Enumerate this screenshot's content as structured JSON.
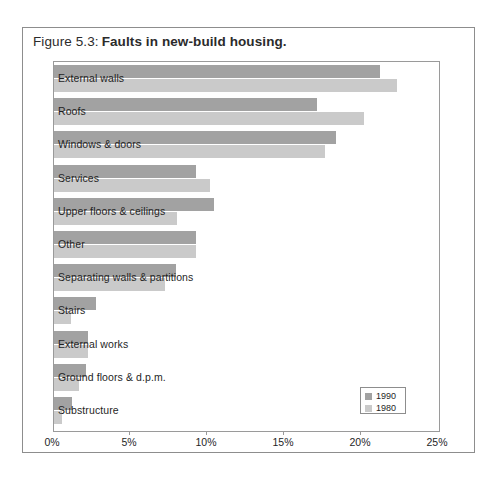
{
  "figure": {
    "number": "Figure 5.3:",
    "title": "Faults in new-build housing."
  },
  "legend": {
    "items": [
      {
        "label": "1990",
        "color": "#a2a2a2"
      },
      {
        "label": "1980",
        "color": "#cacaca"
      }
    ]
  },
  "axis": {
    "ticks": [
      "0%",
      "5%",
      "10%",
      "15%",
      "20%",
      "25%"
    ]
  },
  "chart_data": {
    "type": "bar",
    "orientation": "horizontal",
    "title": "Faults in new-build housing.",
    "xlabel": "",
    "ylabel": "",
    "xlim": [
      0,
      25
    ],
    "xtick_values": [
      0,
      5,
      10,
      15,
      20,
      25
    ],
    "xtick_labels": [
      "0%",
      "5%",
      "10%",
      "15%",
      "20%",
      "25%"
    ],
    "grid": false,
    "legend_position": "bottom-right",
    "categories": [
      "External walls",
      "Roofs",
      "Windows & doors",
      "Services",
      "Upper floors & ceilings",
      "Other",
      "Separating walls & partitions",
      "Stairs",
      "External works",
      "Ground floors & d.p.m.",
      "Substructure"
    ],
    "series": [
      {
        "name": "1990",
        "color": "#a2a2a2",
        "values": [
          21.2,
          17.1,
          18.3,
          9.2,
          10.4,
          9.2,
          7.9,
          2.7,
          2.2,
          2.1,
          1.2
        ]
      },
      {
        "name": "1980",
        "color": "#cacaca",
        "values": [
          22.3,
          20.1,
          17.6,
          10.1,
          8.0,
          9.2,
          7.2,
          1.1,
          2.2,
          1.6,
          0.5
        ]
      }
    ]
  }
}
